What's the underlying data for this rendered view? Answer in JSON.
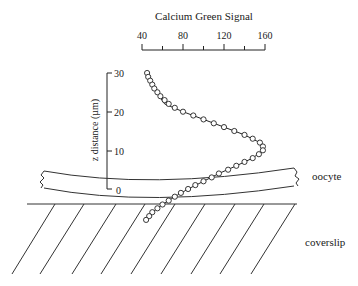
{
  "figure": {
    "x_axis_title": "Calcium Green Signal",
    "y_axis_title": "z distance (µm)",
    "x_ticks": [
      "40",
      "80",
      "120",
      "160"
    ],
    "y_ticks": [
      "0",
      "10",
      "20",
      "30"
    ],
    "labels": {
      "oocyte": "oocyte",
      "coverslip": "coverslip"
    }
  },
  "chart_data": {
    "type": "scatter",
    "title": "Calcium Green Signal",
    "xlabel": "Calcium Green Signal",
    "ylabel": "z distance (µm)",
    "xlim": [
      40,
      160
    ],
    "ylim": [
      0,
      30
    ],
    "x_tick_labels": [
      "40",
      "80",
      "120",
      "160"
    ],
    "y_tick_labels": [
      "0",
      "10",
      "20",
      "30"
    ],
    "grid": false,
    "legend": null,
    "series": [
      {
        "name": "measured (circles)",
        "points": [
          {
            "x": 45,
            "z": 30
          },
          {
            "x": 46,
            "z": 29
          },
          {
            "x": 48,
            "z": 28
          },
          {
            "x": 50,
            "z": 27
          },
          {
            "x": 52,
            "z": 26
          },
          {
            "x": 55,
            "z": 25
          },
          {
            "x": 58,
            "z": 24
          },
          {
            "x": 62,
            "z": 23
          },
          {
            "x": 66,
            "z": 22
          },
          {
            "x": 72,
            "z": 21
          },
          {
            "x": 80,
            "z": 20
          },
          {
            "x": 90,
            "z": 19
          },
          {
            "x": 100,
            "z": 18
          },
          {
            "x": 110,
            "z": 17
          },
          {
            "x": 120,
            "z": 16
          },
          {
            "x": 130,
            "z": 15
          },
          {
            "x": 140,
            "z": 14
          },
          {
            "x": 148,
            "z": 13
          },
          {
            "x": 155,
            "z": 12
          },
          {
            "x": 158,
            "z": 11
          },
          {
            "x": 158,
            "z": 10
          },
          {
            "x": 154,
            "z": 9
          },
          {
            "x": 148,
            "z": 8
          },
          {
            "x": 140,
            "z": 7
          },
          {
            "x": 132,
            "z": 6
          },
          {
            "x": 124,
            "z": 5
          },
          {
            "x": 115,
            "z": 4
          },
          {
            "x": 108,
            "z": 3
          },
          {
            "x": 100,
            "z": 2
          },
          {
            "x": 92,
            "z": 1
          },
          {
            "x": 85,
            "z": 0
          },
          {
            "x": 78,
            "z": -1
          },
          {
            "x": 72,
            "z": -2
          },
          {
            "x": 66,
            "z": -3
          },
          {
            "x": 60,
            "z": -4
          },
          {
            "x": 55,
            "z": -5
          },
          {
            "x": 50,
            "z": -6
          },
          {
            "x": 47,
            "z": -7
          },
          {
            "x": 44,
            "z": -8
          }
        ]
      },
      {
        "name": "fit (solid line)",
        "type": "line",
        "points": [
          {
            "x": 46,
            "z": 30
          },
          {
            "x": 52,
            "z": 26
          },
          {
            "x": 62,
            "z": 22
          },
          {
            "x": 80,
            "z": 20
          },
          {
            "x": 100,
            "z": 18
          },
          {
            "x": 120,
            "z": 16
          },
          {
            "x": 140,
            "z": 14
          },
          {
            "x": 155,
            "z": 12
          },
          {
            "x": 158,
            "z": 10
          },
          {
            "x": 148,
            "z": 8
          },
          {
            "x": 132,
            "z": 6
          },
          {
            "x": 115,
            "z": 4
          },
          {
            "x": 100,
            "z": 2
          },
          {
            "x": 85,
            "z": 0
          },
          {
            "x": 72,
            "z": -2
          },
          {
            "x": 60,
            "z": -4
          },
          {
            "x": 50,
            "z": -6
          },
          {
            "x": 45,
            "z": -8
          }
        ]
      }
    ],
    "annotations": [
      "oocyte",
      "coverslip"
    ]
  }
}
